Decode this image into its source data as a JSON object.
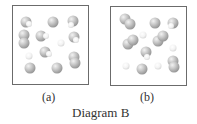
{
  "figure": {
    "caption": "Diagram B",
    "panels": [
      {
        "id": "a",
        "label": "(a)",
        "box": {
          "x": 12,
          "y": 5,
          "w": 77,
          "h": 80
        },
        "atoms": [
          {
            "x": 26,
            "y": 22,
            "r": 5.5,
            "c": "gray"
          },
          {
            "x": 29,
            "y": 24,
            "r": 3,
            "c": "white"
          },
          {
            "x": 53,
            "y": 22,
            "r": 5.5,
            "c": "gray"
          },
          {
            "x": 73,
            "y": 21,
            "r": 5.5,
            "c": "gray"
          },
          {
            "x": 71,
            "y": 25,
            "r": 3,
            "c": "white"
          },
          {
            "x": 24,
            "y": 35,
            "r": 5.5,
            "c": "gray"
          },
          {
            "x": 24,
            "y": 43,
            "r": 5.5,
            "c": "gray"
          },
          {
            "x": 41,
            "y": 36,
            "r": 5.5,
            "c": "gray"
          },
          {
            "x": 46,
            "y": 36,
            "r": 3,
            "c": "white"
          },
          {
            "x": 61,
            "y": 43,
            "r": 3.5,
            "c": "white"
          },
          {
            "x": 74,
            "y": 37,
            "r": 5.5,
            "c": "gray"
          },
          {
            "x": 76,
            "y": 40,
            "r": 3,
            "c": "white"
          },
          {
            "x": 29,
            "y": 56,
            "r": 3.5,
            "c": "white"
          },
          {
            "x": 45,
            "y": 52,
            "r": 5.5,
            "c": "gray"
          },
          {
            "x": 49,
            "y": 54,
            "r": 3,
            "c": "white"
          },
          {
            "x": 74,
            "y": 57,
            "r": 5.5,
            "c": "gray"
          },
          {
            "x": 75,
            "y": 63,
            "r": 5.5,
            "c": "gray"
          },
          {
            "x": 30,
            "y": 68,
            "r": 5.5,
            "c": "gray"
          },
          {
            "x": 57,
            "y": 68,
            "r": 5.5,
            "c": "gray"
          }
        ]
      },
      {
        "id": "b",
        "label": "(b)",
        "box": {
          "x": 110,
          "y": 6,
          "w": 77,
          "h": 80
        },
        "atoms": [
          {
            "x": 125,
            "y": 19,
            "r": 5.5,
            "c": "gray"
          },
          {
            "x": 130,
            "y": 24,
            "r": 5.5,
            "c": "gray"
          },
          {
            "x": 155,
            "y": 23,
            "r": 5.5,
            "c": "gray"
          },
          {
            "x": 173,
            "y": 23,
            "r": 5.5,
            "c": "gray"
          },
          {
            "x": 171,
            "y": 26,
            "r": 3,
            "c": "white"
          },
          {
            "x": 143,
            "y": 35,
            "r": 3.5,
            "c": "white"
          },
          {
            "x": 128,
            "y": 44,
            "r": 5.5,
            "c": "gray"
          },
          {
            "x": 133,
            "y": 40,
            "r": 5.5,
            "c": "gray"
          },
          {
            "x": 158,
            "y": 41,
            "r": 5.5,
            "c": "gray"
          },
          {
            "x": 163,
            "y": 36,
            "r": 5.5,
            "c": "gray"
          },
          {
            "x": 173,
            "y": 48,
            "r": 3.5,
            "c": "white"
          },
          {
            "x": 146,
            "y": 52,
            "r": 5.5,
            "c": "gray"
          },
          {
            "x": 147,
            "y": 57,
            "r": 3,
            "c": "white"
          },
          {
            "x": 126,
            "y": 66,
            "r": 3.5,
            "c": "white"
          },
          {
            "x": 142,
            "y": 69,
            "r": 5.5,
            "c": "gray"
          },
          {
            "x": 158,
            "y": 66,
            "r": 3.5,
            "c": "white"
          },
          {
            "x": 173,
            "y": 61,
            "r": 5.5,
            "c": "gray"
          },
          {
            "x": 174,
            "y": 67,
            "r": 5.5,
            "c": "gray"
          }
        ]
      }
    ],
    "colors": {
      "border": "#6b6b6b",
      "text": "#333333"
    }
  }
}
